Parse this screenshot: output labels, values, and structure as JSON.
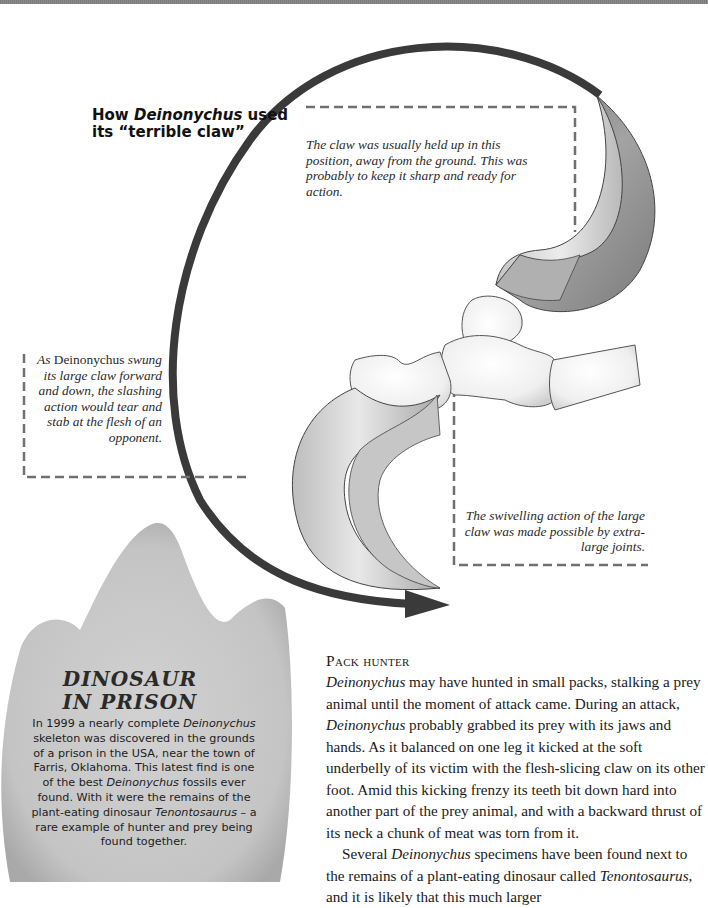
{
  "page": {
    "top_band_color": "#808080"
  },
  "diagram": {
    "title_parts": [
      "How ",
      "Deinonychus",
      " used its “terrible claw”"
    ],
    "captions": {
      "top": "The claw was usually held up in this position, away from the ground. This was probably to keep it sharp and ready for action.",
      "left_lead": "As",
      "left_name": "Deinonychus",
      "left_rest": "swung its large claw forward and down, the slashing action would tear and stab at the flesh of an opponent.",
      "right": "The swivelling action of the large claw was made possible by extra-large joints."
    },
    "icons": {
      "motion_arrow": "curved-arrow-icon",
      "raised_claw": "raised-claw-illustration",
      "lowered_claw": "lowered-claw-illustration",
      "toe_bones": "toe-bones-illustration"
    },
    "colors": {
      "arrow": "#3a3a3a",
      "claw_dark": "#8a8a8a",
      "claw_light": "#d6d6d6",
      "bone": "#f2f2f2",
      "leader_line": "#707070"
    }
  },
  "sidebar_box": {
    "shape": "footprint",
    "title_line1": "DINOSAUR",
    "title_line2": "IN PRISON",
    "body_parts": [
      "In 1999 a nearly complete ",
      "Deinonychus",
      " skeleton was discovered in the grounds of a prison in the USA, near the town of Farris, Oklahoma. This latest find is one of the best ",
      "Deinonychus",
      " fossils ever found. With it were the remains of the plant-eating dinosaur ",
      "Tenontosaurus",
      " – a rare example of hunter and prey being found together."
    ],
    "fill_color": "#c9c9c9"
  },
  "article": {
    "heading": "Pack hunter",
    "p1_parts": [
      "Deinonychus",
      " may have hunted in small packs, stalking a prey animal until the moment of attack came. During an attack, ",
      "Deinonychus",
      " probably grabbed its prey with its jaws and hands. As it balanced on one leg it kicked at the soft underbelly of its victim with the flesh-slicing claw on its other foot. Amid this kicking frenzy its teeth bit down hard into another part of the prey animal, and with a backward thrust of its neck a chunk of meat was torn from it."
    ],
    "p2_parts": [
      "Several ",
      "Deinonychus",
      " specimens have been found next to the remains of a plant-eating dinosaur called ",
      "Tenontosaurus",
      ", and it is likely that this much larger"
    ]
  }
}
